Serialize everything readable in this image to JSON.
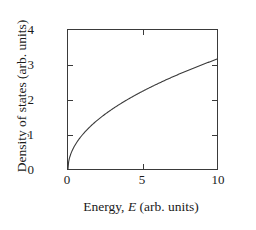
{
  "figure": {
    "background_color": "#ffffff",
    "line_color": "#3a3a3a"
  },
  "chart_data": {
    "type": "line",
    "title": "",
    "xlabel_prefix": "Energy,",
    "xlabel_symbol": "E",
    "xlabel_suffix": "(arb. units)",
    "xlabel": "Energy, E (arb. units)",
    "ylabel": "Density of states (arb. units)",
    "xlim": [
      0,
      10
    ],
    "ylim": [
      0,
      4
    ],
    "xticks": [
      0,
      5,
      10
    ],
    "xticklabels": [
      "0",
      "5",
      "10"
    ],
    "yticks": [
      0,
      1,
      2,
      3,
      4
    ],
    "yticklabels": [
      "0",
      "1",
      "2",
      "3",
      "4"
    ],
    "grid": false,
    "legend": "none",
    "frame": "box",
    "tick_direction": "in",
    "series": [
      {
        "name": "Density of states",
        "relation": "y = sqrt(x)",
        "x": [
          0.0,
          0.1,
          0.25,
          0.5,
          0.75,
          1.0,
          1.5,
          2.0,
          2.5,
          3.0,
          3.5,
          4.0,
          4.5,
          5.0,
          5.5,
          6.0,
          6.5,
          7.0,
          7.5,
          8.0,
          8.5,
          9.0,
          9.5,
          10.0
        ],
        "y": [
          0.0,
          0.32,
          0.5,
          0.71,
          0.87,
          1.0,
          1.22,
          1.41,
          1.58,
          1.73,
          1.87,
          2.0,
          2.12,
          2.24,
          2.35,
          2.45,
          2.55,
          2.65,
          2.74,
          2.83,
          2.92,
          3.0,
          3.08,
          3.16
        ]
      }
    ]
  }
}
